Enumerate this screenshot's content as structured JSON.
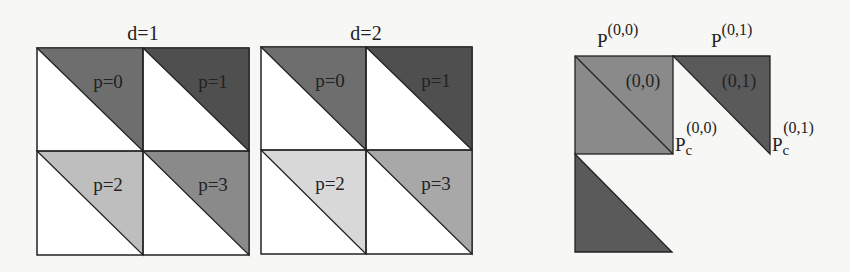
{
  "panels": [
    {
      "title": "d=1",
      "cells": [
        {
          "label": "p=0",
          "color": "#6e6e6e"
        },
        {
          "label": "p=1",
          "color": "#4f4f4f"
        },
        {
          "label": "p=2",
          "color": "#bebebe"
        },
        {
          "label": "p=3",
          "color": "#8a8a8a"
        }
      ]
    },
    {
      "title": "d=2",
      "cells": [
        {
          "label": "p=0",
          "color": "#6e6e6e"
        },
        {
          "label": "p=1",
          "color": "#4f4f4f"
        },
        {
          "label": "p=2",
          "color": "#d8d8d8"
        },
        {
          "label": "p=3",
          "color": "#a8a8a8"
        }
      ]
    }
  ],
  "block_diagram": {
    "top_labels": [
      {
        "base": "P",
        "sup": "(0,0)"
      },
      {
        "base": "P",
        "sup": "(0,1)"
      }
    ],
    "blocks": [
      {
        "label": "(0,0)",
        "color": "#8a8a8a"
      },
      {
        "label": "(0,1)",
        "color": "#5a5a5a"
      },
      {
        "label": "",
        "color": "#5a5a5a"
      }
    ],
    "corner_labels": [
      {
        "base": "P",
        "sub": "c",
        "sup": "(0,0)"
      },
      {
        "base": "P",
        "sub": "c",
        "sup": "(0,1)"
      }
    ]
  }
}
